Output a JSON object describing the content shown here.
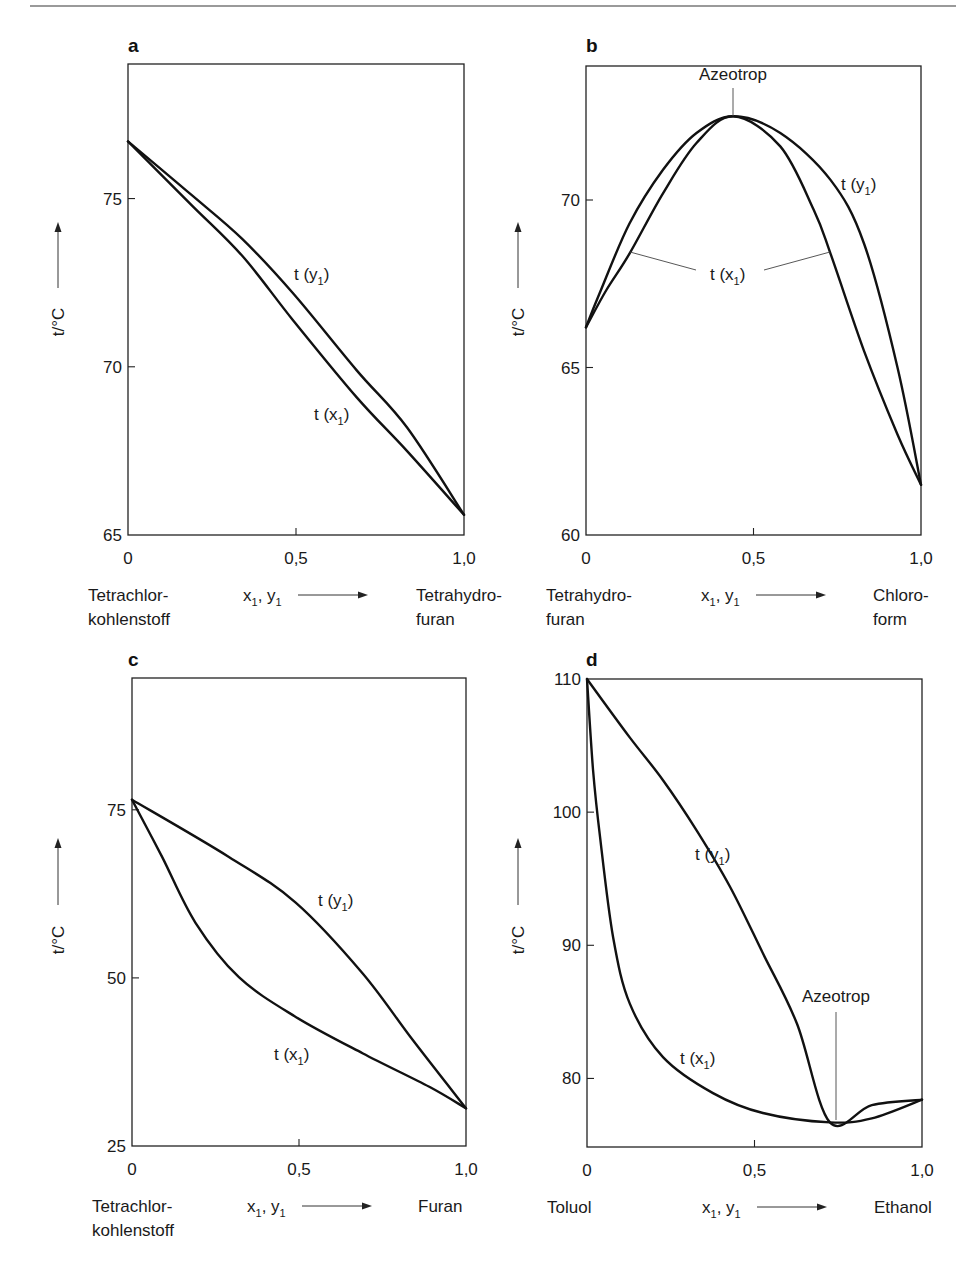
{
  "figure": {
    "top_rule": true
  },
  "chart_data": [
    {
      "panel": "a",
      "type": "line",
      "title": "",
      "xlabel": "x1, y1",
      "ylabel": "t/°C",
      "xlim": [
        0,
        1
      ],
      "ylim": [
        65,
        79
      ],
      "xticks": [
        "0",
        "0,5",
        "1,0"
      ],
      "yticks": [
        65,
        70,
        75
      ],
      "grid": false,
      "left_component": [
        "Tetrachlor-",
        "kohlenstoff"
      ],
      "right_component": [
        "Tetrahydro-",
        "furan"
      ],
      "series": [
        {
          "name": "t (y1)",
          "x": [
            0,
            0.19,
            0.34,
            0.49,
            0.68,
            0.83,
            1.0
          ],
          "y": [
            76.7,
            75.1,
            73.8,
            72.2,
            69.9,
            68.2,
            65.6
          ]
        },
        {
          "name": "t (x1)",
          "x": [
            0,
            0.19,
            0.34,
            0.49,
            0.68,
            0.83,
            1.0
          ],
          "y": [
            76.7,
            74.8,
            73.3,
            71.4,
            69.1,
            67.5,
            65.6
          ]
        }
      ],
      "annotations": []
    },
    {
      "panel": "b",
      "type": "line",
      "title": "",
      "xlabel": "x1, y1",
      "ylabel": "t/°C",
      "xlim": [
        0,
        1
      ],
      "ylim": [
        60,
        74
      ],
      "xticks": [
        "0",
        "0,5",
        "1,0"
      ],
      "yticks": [
        60,
        65,
        70
      ],
      "grid": false,
      "left_component": [
        "Tetrahydro-",
        "furan"
      ],
      "right_component": [
        "Chloro-",
        "form"
      ],
      "series": [
        {
          "name": "t (y1)",
          "x": [
            0,
            0.04,
            0.13,
            0.23,
            0.33,
            0.44,
            0.58,
            0.73,
            0.83,
            0.93,
            1.0
          ],
          "y": [
            66.2,
            67.2,
            69.3,
            70.9,
            72.0,
            72.5,
            72.0,
            70.6,
            68.7,
            65.0,
            61.5
          ]
        },
        {
          "name": "t (x1)",
          "x": [
            0,
            0.06,
            0.13,
            0.23,
            0.33,
            0.44,
            0.58,
            0.68,
            0.73,
            0.83,
            0.93,
            1.0
          ],
          "y": [
            66.2,
            67.3,
            68.4,
            70.2,
            71.7,
            72.5,
            71.6,
            69.7,
            68.4,
            65.5,
            63.0,
            61.5
          ]
        }
      ],
      "annotations": [
        {
          "text": "Azeotrop",
          "x": 0.44,
          "y": 72.5
        }
      ]
    },
    {
      "panel": "c",
      "type": "line",
      "title": "",
      "xlabel": "x1, y1",
      "ylabel": "t/°C",
      "xlim": [
        0,
        1
      ],
      "ylim": [
        25,
        94.6
      ],
      "xticks": [
        "0",
        "0,5",
        "1,0"
      ],
      "yticks": [
        25,
        50,
        75
      ],
      "grid": false,
      "left_component": [
        "Tetrachlor-",
        "kohlenstoff"
      ],
      "right_component": [
        "Furan"
      ],
      "series": [
        {
          "name": "t (y1)",
          "x": [
            0,
            0.29,
            0.49,
            0.69,
            0.84,
            1.0
          ],
          "y": [
            76.5,
            68.0,
            61.2,
            50.7,
            40.8,
            30.6
          ]
        },
        {
          "name": "t (x1)",
          "x": [
            0,
            0.09,
            0.19,
            0.32,
            0.49,
            0.69,
            0.89,
            1.0
          ],
          "y": [
            76.5,
            68.0,
            58.2,
            50.1,
            44.2,
            38.8,
            33.8,
            30.6
          ]
        }
      ],
      "annotations": []
    },
    {
      "panel": "d",
      "type": "line",
      "title": "",
      "xlabel": "x1, y1",
      "ylabel": "t/°C",
      "xlim": [
        0,
        1
      ],
      "ylim": [
        74.85,
        110
      ],
      "xticks": [
        "0",
        "0,5",
        "1,0"
      ],
      "yticks": [
        80,
        90,
        100,
        110
      ],
      "grid": false,
      "left_component": [
        "Toluol"
      ],
      "right_component": [
        "Ethanol"
      ],
      "series": [
        {
          "name": "t (y1)",
          "x": [
            0,
            0.128,
            0.227,
            0.328,
            0.427,
            0.525,
            0.627,
            0.725,
            0.85,
            1.0
          ],
          "y": [
            110,
            105.6,
            102.4,
            98.6,
            94.4,
            89.4,
            84.1,
            76.7,
            78.0,
            78.4
          ]
        },
        {
          "name": "t (x1)",
          "x": [
            0,
            0.018,
            0.039,
            0.078,
            0.128,
            0.227,
            0.376,
            0.525,
            0.725,
            0.85,
            1.0
          ],
          "y": [
            110,
            103.2,
            98.1,
            90.6,
            85.6,
            81.6,
            78.9,
            77.4,
            76.7,
            77.0,
            78.4
          ]
        }
      ],
      "annotations": [
        {
          "text": "Azeotrop",
          "x": 0.725,
          "y": 76.7
        }
      ]
    }
  ],
  "labels": {
    "ylabel": "t/°C",
    "x_axis": {
      "x": "x",
      "y": "y",
      "sub": "1"
    },
    "curve_t": "t (",
    "curve_close": ")",
    "azeotrop": "Azeotrop",
    "panel_letters": [
      "a",
      "b",
      "c",
      "d"
    ]
  }
}
